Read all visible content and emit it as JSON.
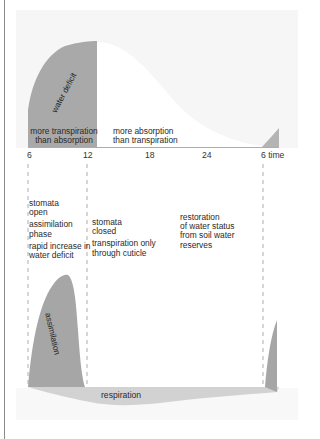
{
  "diagram": {
    "top_panel": {
      "water_deficit_label": "water deficit",
      "left_region_label_line1": "more transpiration",
      "left_region_label_line2": "than absorption",
      "right_region_label_line1": "more absorption",
      "right_region_label_line2": "than transpiration"
    },
    "time_axis": {
      "ticks": [
        "6",
        "12",
        "18",
        "24",
        "6 time"
      ]
    },
    "phases": {
      "morning": {
        "line1": "stomata",
        "line2": "open",
        "line3": "assimilation",
        "line4": "phase",
        "line5": "rapid increase in",
        "line6": "water deficit"
      },
      "afternoon": {
        "line1": "stomata",
        "line2": "closed",
        "line3": "transpiration only",
        "line4": "through cuticle"
      },
      "night": {
        "line1": "restoration",
        "line2": "of water status",
        "line3": "from soil water",
        "line4": "reserves"
      }
    },
    "bottom_panel": {
      "assimilation_label": "assimilation",
      "respiration_label": "respiration"
    },
    "colors": {
      "dark_fill": "#a9a9a9",
      "light_fill": "#d4d4d4",
      "panel_bg": "#f4f4f4",
      "text": "#2a2a2a"
    }
  }
}
